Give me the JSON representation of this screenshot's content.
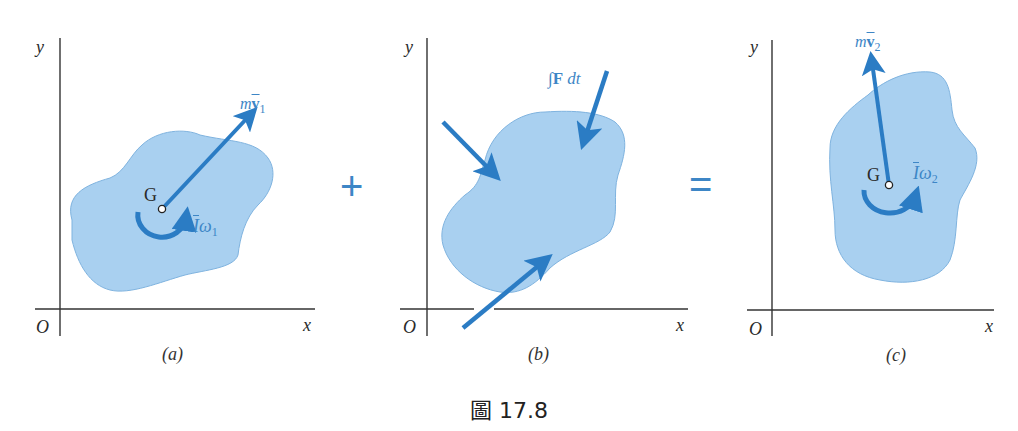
{
  "figure": {
    "caption": "圖 17.8",
    "operators": {
      "plus": "+",
      "equals": "="
    },
    "colors": {
      "body_fill": "#a9d0f0",
      "body_stroke": "#6fa8d8",
      "vector": "#2b7cc4",
      "label_blue": "#3d86c6",
      "axis": "#333333"
    },
    "panels": [
      {
        "id": "a",
        "sublabel": "(a)",
        "axes": {
          "origin": "O",
          "x": "x",
          "y": "y"
        },
        "center_label": "G",
        "momentum_label": {
          "m": "m",
          "v": "v",
          "sub": "1"
        },
        "angular_label": {
          "I": "I",
          "w": "ω",
          "sub": "1"
        }
      },
      {
        "id": "b",
        "sublabel": "(b)",
        "axes": {
          "origin": "O",
          "x": "x",
          "y": "y"
        },
        "impulse_label": {
          "int": "∫",
          "F": "F",
          "dt": " dt"
        },
        "impulse_arrows": 3
      },
      {
        "id": "c",
        "sublabel": "(c)",
        "axes": {
          "origin": "O",
          "x": "x",
          "y": "y"
        },
        "center_label": "G",
        "momentum_label": {
          "m": "m",
          "v": "v",
          "sub": "2"
        },
        "angular_label": {
          "I": "I",
          "w": "ω",
          "sub": "2"
        }
      }
    ]
  }
}
